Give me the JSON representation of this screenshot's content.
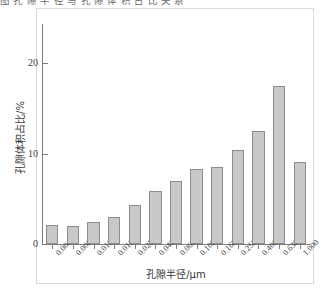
{
  "top_caption": "图 孔 隙 半 径 与 孔 隙 体 积 占 比 关 系",
  "chart_data": {
    "type": "bar",
    "title": "",
    "xlabel": "孔隙半径/μm",
    "ylabel": "孔隙体积占比/%",
    "categories": [
      "0.004",
      "0.006",
      "0.010",
      "0.016",
      "0.025",
      "0.040",
      "0.063",
      "0.100",
      "0.160",
      "0.250",
      "0.400",
      "0.630",
      "1.000"
    ],
    "values": [
      2.1,
      2.0,
      2.4,
      3.0,
      4.3,
      5.9,
      7.0,
      8.3,
      8.5,
      10.4,
      12.5,
      17.5,
      9.1
    ],
    "ylim": [
      0,
      24
    ],
    "xlim_note": "categorical",
    "yticks": [
      0,
      10,
      20
    ],
    "ytick_labels": [
      "0",
      "10",
      "20"
    ],
    "grid": false,
    "legend": false,
    "bar_color": "#c9c9c9",
    "bar_edge_color": "#8c8c8c",
    "axis_color": "#7d7d7d",
    "xtick_rotation_deg": -45
  }
}
